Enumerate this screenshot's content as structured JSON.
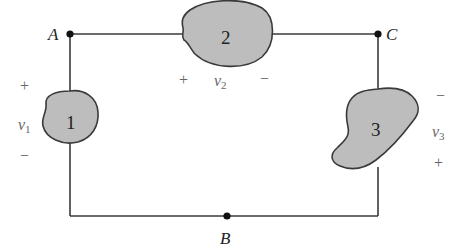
{
  "diagram": {
    "type": "circuit",
    "nodes": [
      {
        "id": "A",
        "label": "A"
      },
      {
        "id": "B",
        "label": "B"
      },
      {
        "id": "C",
        "label": "C"
      }
    ],
    "elements": [
      {
        "id": "1",
        "label": "1",
        "between": [
          "A",
          "B"
        ],
        "voltage": {
          "symbol": "v",
          "subscript": "1",
          "plus": "+",
          "minus": "−",
          "plus_side": "top"
        }
      },
      {
        "id": "2",
        "label": "2",
        "between": [
          "A",
          "C"
        ],
        "voltage": {
          "symbol": "v",
          "subscript": "2",
          "plus": "+",
          "minus": "−",
          "plus_side": "left"
        }
      },
      {
        "id": "3",
        "label": "3",
        "between": [
          "C",
          "B"
        ],
        "voltage": {
          "symbol": "v",
          "subscript": "3",
          "plus": "+",
          "minus": "−",
          "plus_side": "bottom"
        }
      }
    ],
    "colors": {
      "wire": "#3a3a3a",
      "element_fill": "#bdbdbd",
      "node_dot": "#111111",
      "label_text": "#222222",
      "polarity_text": "#666666"
    }
  }
}
